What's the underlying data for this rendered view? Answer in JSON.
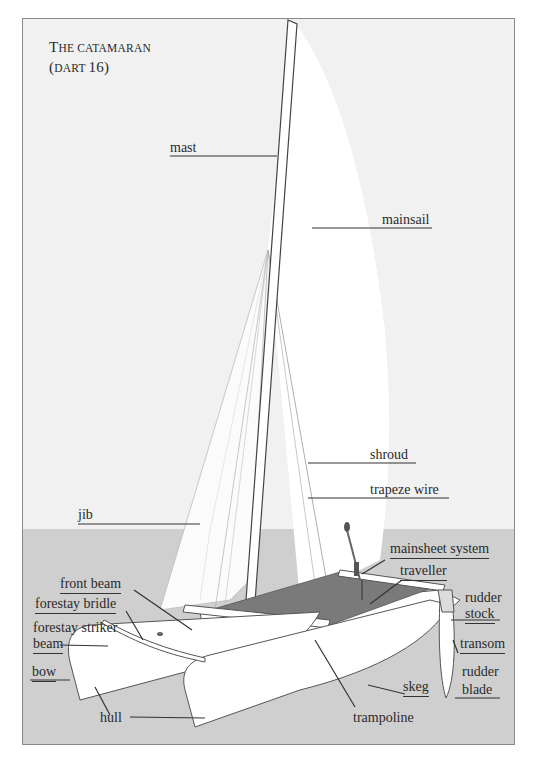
{
  "title": {
    "line1_cap": "T",
    "line1_rest": "he catamaran",
    "line2_open": "(",
    "line2_sc": "dart ",
    "line2_num": "16",
    "line2_close": ")"
  },
  "labels": {
    "mast": "mast",
    "mainsail": "mainsail",
    "shroud": "shroud",
    "trapeze_wire": "trapeze wire",
    "jib": "jib",
    "mainsheet_system": "mainsheet system",
    "traveller": "traveller",
    "front_beam": "front beam",
    "forestay_bridle": "forestay bridle",
    "forestay_striker": "forestay striker",
    "beam": "beam",
    "bow": "bow",
    "hull": "hull",
    "trampoline": "trampoline",
    "skeg": "skeg",
    "rudder_stock_1": "rudder",
    "rudder_stock_2": "stock",
    "transom": "transom",
    "rudder_blade_1": "rudder",
    "rudder_blade_2": "blade"
  },
  "colors": {
    "sky": "#f1f1f1",
    "water": "#cfcfcf",
    "sail": "#ffffff",
    "trampoline": "#7a7a7a",
    "line": "#333333"
  }
}
